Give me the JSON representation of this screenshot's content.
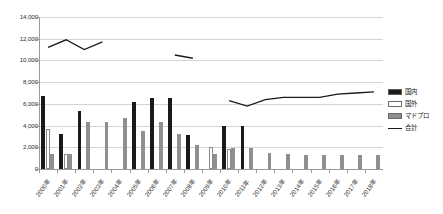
{
  "chart_data": {
    "type": "bar",
    "title": "",
    "xlabel": "",
    "ylabel": "",
    "ylim": [
      0,
      14000
    ],
    "ytick_values": [
      0,
      2000,
      4000,
      6000,
      8000,
      10000,
      12000,
      14000
    ],
    "ytick_labels": [
      "0",
      "2,000",
      "4,000",
      "6,000",
      "8,000",
      "10,000",
      "12,000",
      "14,000"
    ],
    "grid": true,
    "legend_position": "right",
    "categories": [
      "2000年",
      "2001年",
      "2002年",
      "2003年",
      "2004年",
      "2005年",
      "2006年",
      "2007年",
      "2008年",
      "2009年",
      "2010年",
      "2011年",
      "2012年",
      "2013年",
      "2014年",
      "2015年",
      "2016年",
      "2017年",
      "2018年"
    ],
    "series": [
      {
        "name": "国内",
        "type": "bar",
        "color": "#1a1a1a",
        "values": [
          6700,
          3200,
          5300,
          null,
          null,
          6200,
          6500,
          6500,
          3100,
          null,
          4000,
          4000,
          null,
          null,
          null,
          null,
          null,
          null,
          null
        ]
      },
      {
        "name": "国外",
        "type": "bar",
        "color": "#ffffff",
        "values": [
          3700,
          1400,
          null,
          null,
          null,
          null,
          null,
          null,
          null,
          2000,
          1800,
          null,
          null,
          null,
          null,
          null,
          null,
          null,
          null
        ]
      },
      {
        "name": "マドプロ",
        "type": "bar",
        "color": "#8f8f8f",
        "values": [
          1400,
          1400,
          4300,
          4300,
          4700,
          3500,
          4300,
          3200,
          2200,
          1400,
          1900,
          1900,
          1500,
          1400,
          1300,
          1300,
          1300,
          1300,
          1300
        ]
      },
      {
        "name": "合計",
        "type": "line",
        "color": "#1a1a1a",
        "values": [
          11200,
          11900,
          11000,
          11700,
          null,
          null,
          null,
          10500,
          10200,
          null,
          6300,
          5800,
          6400,
          6600,
          6600,
          6600,
          6900,
          7000,
          7100
        ]
      }
    ]
  },
  "legend": {
    "items": [
      {
        "label": "国内",
        "swatch": "domestic"
      },
      {
        "label": "国外",
        "swatch": "foreign"
      },
      {
        "label": "マドプロ",
        "swatch": "madopro"
      },
      {
        "label": "合計",
        "swatch": "total"
      }
    ]
  }
}
